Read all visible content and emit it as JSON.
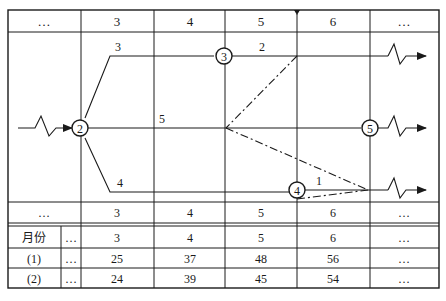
{
  "diagram": {
    "type": "time-scaled network diagram with cost table",
    "top_time_scale": [
      "…",
      "3",
      "4",
      "5",
      "6",
      "…"
    ],
    "bottom_time_scale": [
      "…",
      "3",
      "4",
      "5",
      "6",
      "…"
    ],
    "nodes": [
      {
        "id": "2",
        "label": "2"
      },
      {
        "id": "3",
        "label": "3"
      },
      {
        "id": "4",
        "label": "4"
      },
      {
        "id": "5",
        "label": "5"
      }
    ],
    "activity_labels": {
      "a_2_3": "3",
      "a_3_out": "2",
      "a_2_5": "5",
      "a_2_4": "4",
      "a_4_out": "1"
    },
    "cost_table": {
      "header": {
        "label": "月份",
        "ellipsis": "…",
        "values": [
          "3",
          "4",
          "5",
          "6",
          "…"
        ]
      },
      "rows": [
        {
          "label": "(1)",
          "ellipsis": "…",
          "values": [
            "25",
            "37",
            "48",
            "56",
            "…"
          ]
        },
        {
          "label": "(2)",
          "ellipsis": "…",
          "values": [
            "24",
            "39",
            "45",
            "54",
            "…"
          ]
        }
      ]
    }
  },
  "colors": {
    "line": "#1a1a1a",
    "background": "#ffffff"
  }
}
